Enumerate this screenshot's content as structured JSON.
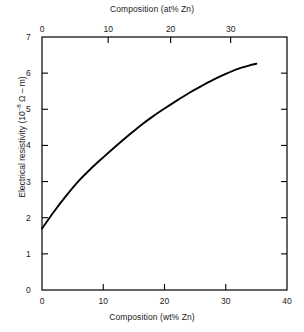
{
  "chart_data": {
    "type": "line",
    "title": "",
    "xlabel": "Composition (wt% Zn)",
    "ylabel": "Electrical resistivity (10-8 Ω – m)",
    "ylabel_prefix": "Electrical resistivity (10",
    "ylabel_exponent": "–8",
    "ylabel_suffix": " Ω – m)",
    "secondary_xlabel": "Composition (at% Zn)",
    "xlim": [
      0,
      40
    ],
    "ylim": [
      0,
      7
    ],
    "secondary_xlim": [
      0,
      40
    ],
    "grid": false,
    "legend": "none",
    "xticks": [
      "0",
      "10",
      "20",
      "30",
      "40"
    ],
    "xtick_values": [
      0,
      10,
      20,
      30,
      40
    ],
    "yticks": [
      "0",
      "1",
      "2",
      "3",
      "4",
      "5",
      "6",
      "7"
    ],
    "ytick_values": [
      0,
      1,
      2,
      3,
      4,
      5,
      6,
      7
    ],
    "secondary_xticks": [
      "0",
      "10",
      "20",
      "30"
    ],
    "secondary_xtick_values": [
      0,
      10,
      20,
      30
    ],
    "secondary_xtick_positions_wt": [
      0,
      10.8,
      21.0,
      30.8
    ],
    "series": [
      {
        "name": "Copper-zinc alloy resistivity",
        "color": "#000000",
        "x": [
          0,
          2,
          4,
          6,
          8,
          10,
          12,
          14,
          16,
          18,
          20,
          22,
          24,
          26,
          28,
          30,
          32,
          34,
          35
        ],
        "values": [
          1.7,
          2.18,
          2.62,
          3.02,
          3.36,
          3.67,
          3.97,
          4.26,
          4.54,
          4.79,
          5.02,
          5.24,
          5.45,
          5.64,
          5.82,
          5.98,
          6.12,
          6.22,
          6.26
        ]
      }
    ]
  }
}
